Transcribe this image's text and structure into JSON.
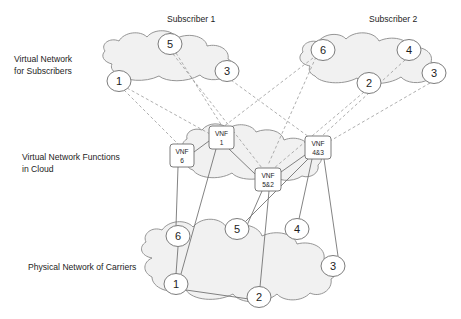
{
  "diagram": {
    "background_color": "#ffffff",
    "cloud_fill_color": "#eeeeee",
    "cloud_stroke_color": "#8a8a8a",
    "dashed_link_color": "#9a9a9a",
    "solid_link_color": "#6d6d6d",
    "node_fill_color": "#ffffff",
    "text_color": "#1d1d1d"
  },
  "layer_labels": [
    {
      "id": "layer-subscribers",
      "text": "Virtual Network\nfor Subscribers",
      "x": 14,
      "y": 54
    },
    {
      "id": "layer-vnf",
      "text": "Virtual Network Functions\nin Cloud",
      "x": 22,
      "y": 152
    },
    {
      "id": "layer-physical",
      "text": "Physical Network of Carriers",
      "x": 28,
      "y": 262
    }
  ],
  "cloud_titles": [
    {
      "id": "subscriber-1-title",
      "text": "Subscriber 1",
      "x": 167,
      "y": 20
    },
    {
      "id": "subscriber-2-title",
      "text": "Subscriber 2",
      "x": 369,
      "y": 20
    }
  ],
  "clouds": [
    {
      "id": "cloud-subscriber-1",
      "label": "Subscriber 1 virtual network cloud"
    },
    {
      "id": "cloud-subscriber-2",
      "label": "Subscriber 2 virtual network cloud"
    },
    {
      "id": "cloud-vnf",
      "label": "Virtual network functions cloud"
    },
    {
      "id": "cloud-physical",
      "label": "Physical carrier network cloud"
    }
  ],
  "subscriber1_nodes": [
    {
      "id": "s1-n5",
      "label": "5",
      "cx": 170,
      "cy": 44,
      "rx": 12,
      "ry": 10.5
    },
    {
      "id": "s1-n1",
      "label": "1",
      "cx": 119,
      "cy": 81,
      "rx": 12,
      "ry": 10.5
    },
    {
      "id": "s1-n3",
      "label": "3",
      "cx": 227,
      "cy": 71,
      "rx": 12,
      "ry": 10.5
    }
  ],
  "subscriber2_nodes": [
    {
      "id": "s2-n6",
      "label": "6",
      "cx": 323,
      "cy": 50,
      "rx": 12,
      "ry": 10.5
    },
    {
      "id": "s2-n4",
      "label": "4",
      "cx": 409,
      "cy": 50,
      "rx": 12,
      "ry": 10.5
    },
    {
      "id": "s2-n2",
      "label": "2",
      "cx": 369,
      "cy": 83,
      "rx": 12,
      "ry": 10.5
    },
    {
      "id": "s2-n3",
      "label": "3",
      "cx": 434,
      "cy": 73,
      "rx": 12,
      "ry": 10.5
    }
  ],
  "vnf_boxes": [
    {
      "id": "vnf-6",
      "line1": "VNF",
      "line2": "6",
      "x": 170,
      "y": 144,
      "w": 24,
      "h": 23
    },
    {
      "id": "vnf-1",
      "line1": "VNF",
      "line2": "1",
      "x": 209,
      "y": 126,
      "w": 25,
      "h": 23
    },
    {
      "id": "vnf-5-2",
      "line1": "VNF",
      "line2": "5&2",
      "x": 255,
      "y": 168,
      "w": 26,
      "h": 23
    },
    {
      "id": "vnf-4-3",
      "line1": "VNF",
      "line2": "4&3",
      "x": 305,
      "y": 136,
      "w": 26,
      "h": 23
    }
  ],
  "physical_nodes": [
    {
      "id": "p-n6",
      "label": "6",
      "cx": 178,
      "cy": 236,
      "rx": 12,
      "ry": 10.5
    },
    {
      "id": "p-n5",
      "label": "5",
      "cx": 237,
      "cy": 229,
      "rx": 12,
      "ry": 10.5
    },
    {
      "id": "p-n4",
      "label": "4",
      "cx": 297,
      "cy": 229,
      "rx": 12,
      "ry": 10.5
    },
    {
      "id": "p-n1",
      "label": "1",
      "cx": 176,
      "cy": 284,
      "rx": 12,
      "ry": 10.5
    },
    {
      "id": "p-n2",
      "label": "2",
      "cx": 259,
      "cy": 297,
      "rx": 12,
      "ry": 10.5
    },
    {
      "id": "p-n3",
      "label": "3",
      "cx": 333,
      "cy": 266,
      "rx": 12,
      "ry": 10.5
    }
  ],
  "dashed_mappings": [
    {
      "id": "map-s1n1-vnf6",
      "from": "s1-n1",
      "to": "vnf-6",
      "x1": 124,
      "y1": 90,
      "x2": 180,
      "y2": 144
    },
    {
      "id": "map-s1n5-vnf52",
      "from": "s1-n5",
      "to": "vnf-5-2",
      "x1": 173,
      "y1": 54,
      "x2": 262,
      "y2": 168
    },
    {
      "id": "map-s1n3-vnf43",
      "from": "s1-n3",
      "to": "vnf-4-3",
      "x1": 231,
      "y1": 81,
      "x2": 308,
      "y2": 136
    },
    {
      "id": "map-s2n6-vnf1",
      "from": "s2-n6",
      "to": "vnf-1",
      "x1": 313,
      "y1": 57,
      "x2": 222,
      "y2": 126
    },
    {
      "id": "map-s2n2-vnf52",
      "from": "s2-n2",
      "to": "vnf-5-2",
      "x1": 364,
      "y1": 92,
      "x2": 272,
      "y2": 168
    },
    {
      "id": "map-s2n4-vnf43",
      "from": "s2-n4",
      "to": "vnf-4-3",
      "x1": 405,
      "y1": 60,
      "x2": 322,
      "y2": 136
    },
    {
      "id": "map-s2n3-vnf43",
      "from": "s2-n3",
      "to": "vnf-4-3",
      "x1": 430,
      "y1": 83,
      "x2": 329,
      "y2": 140
    },
    {
      "id": "map-s1n1-vnf1",
      "from": "s1-n1",
      "to": "vnf-1",
      "x1": 127,
      "y1": 87,
      "x2": 210,
      "y2": 133
    }
  ],
  "solid_mappings": [
    {
      "id": "link-vnf6-p6",
      "from": "vnf-6",
      "to": "p-n6",
      "x1": 178,
      "y1": 167,
      "x2": 176,
      "y2": 226
    },
    {
      "id": "link-vnf1-p1",
      "from": "vnf-1",
      "to": "p-n1",
      "x1": 216,
      "y1": 149,
      "x2": 180,
      "y2": 275
    },
    {
      "id": "link-vnf1-vnf6",
      "from": "vnf-1",
      "to": "vnf-6",
      "x1": 209,
      "y1": 140,
      "x2": 194,
      "y2": 152
    },
    {
      "id": "link-vnf52-p5",
      "from": "vnf-5-2",
      "to": "p-n5",
      "x1": 262,
      "y1": 191,
      "x2": 240,
      "y2": 239
    },
    {
      "id": "link-vnf52-p2",
      "from": "vnf-5-2",
      "to": "p-n2",
      "x1": 268,
      "y1": 191,
      "x2": 260,
      "y2": 287
    },
    {
      "id": "link-vnf52-vnf1",
      "from": "vnf-5-2",
      "to": "vnf-1",
      "x1": 255,
      "y1": 173,
      "x2": 228,
      "y2": 149
    },
    {
      "id": "link-vnf43-vnf52",
      "from": "vnf-4-3",
      "to": "vnf-5-2",
      "x1": 305,
      "y1": 154,
      "x2": 281,
      "y2": 174
    },
    {
      "id": "link-vnf43-p4",
      "from": "vnf-4-3",
      "to": "p-n4",
      "x1": 313,
      "y1": 159,
      "x2": 299,
      "y2": 219
    },
    {
      "id": "link-vnf43-p3",
      "from": "vnf-4-3",
      "to": "p-n3",
      "x1": 324,
      "y1": 159,
      "x2": 337,
      "y2": 256
    },
    {
      "id": "link-vnf43-p5",
      "from": "vnf-4-3",
      "to": "p-n5",
      "x1": 308,
      "y1": 159,
      "x2": 245,
      "y2": 222
    },
    {
      "id": "link-p1-p2",
      "from": "p-n1",
      "to": "p-n2",
      "x1": 186,
      "y1": 290,
      "x2": 248,
      "y2": 299
    },
    {
      "id": "link-p6-p1",
      "from": "p-n6",
      "to": "p-n1",
      "x1": 178,
      "y1": 247,
      "x2": 176,
      "y2": 273
    }
  ]
}
